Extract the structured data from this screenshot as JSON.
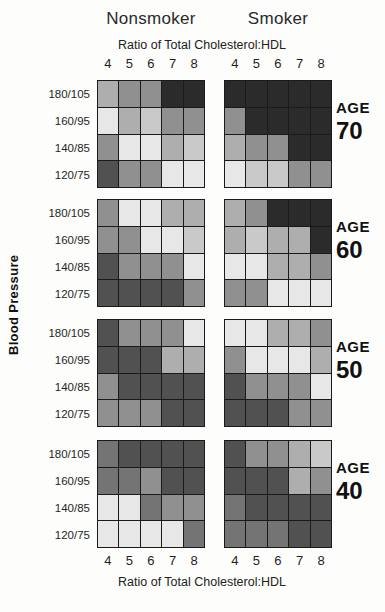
{
  "title_nonsmoker": "Nonsmoker",
  "title_smoker": "Smoker",
  "axis_label_top": "Ratio of Total Cholesterol:HDL",
  "axis_label_bottom": "Ratio of Total Cholesterol:HDL",
  "y_axis_label": "Blood Pressure",
  "age_word": "AGE",
  "ratio_ticks": [
    "4",
    "5",
    "6",
    "7",
    "8"
  ],
  "bp_labels": [
    "180/105",
    "160/95",
    "140/85",
    "120/75"
  ],
  "palette": {
    "VD": "#2b2b2b",
    "D": "#515151",
    "MD": "#747474",
    "M": "#909090",
    "ML": "#aeaeae",
    "L": "#c9c9c9",
    "VL": "#e7e7e7"
  },
  "chart_data": {
    "type": "heatmap",
    "x_categories": [
      "4",
      "5",
      "6",
      "7",
      "8"
    ],
    "xlabel": "Ratio of Total Cholesterol:HDL",
    "y_categories": [
      "180/105",
      "160/95",
      "140/85",
      "120/75"
    ],
    "ylabel": "Blood Pressure",
    "column_groups": [
      "Nonsmoker",
      "Smoker"
    ],
    "row_groups": [
      "AGE 70",
      "AGE 60",
      "AGE 50",
      "AGE 40"
    ],
    "shade_scale_note": "cell codes are gray shades: VD=darkest, D=dark, MD=medium-dark, M=medium, ML=medium-light, L=light, VL=lightest",
    "ages": [
      "70",
      "60",
      "50",
      "40"
    ],
    "grids": {
      "age70_ns": [
        [
          "ML",
          "M",
          "M",
          "VD",
          "VD"
        ],
        [
          "VL",
          "ML",
          "L",
          "M",
          "M"
        ],
        [
          "M",
          "VL",
          "VL",
          "ML",
          "L"
        ],
        [
          "D",
          "M",
          "M",
          "VL",
          "VL"
        ]
      ],
      "age70_s": [
        [
          "VD",
          "VD",
          "VD",
          "VD",
          "VD"
        ],
        [
          "M",
          "VD",
          "VD",
          "VD",
          "VD"
        ],
        [
          "ML",
          "M",
          "M",
          "VD",
          "VD"
        ],
        [
          "VL",
          "L",
          "L",
          "M",
          "M"
        ]
      ],
      "age60_ns": [
        [
          "M",
          "VL",
          "VL",
          "ML",
          "ML"
        ],
        [
          "M",
          "M",
          "VL",
          "VL",
          "L"
        ],
        [
          "D",
          "M",
          "M",
          "M",
          "VL"
        ],
        [
          "D",
          "D",
          "D",
          "D",
          "M"
        ]
      ],
      "age60_s": [
        [
          "ML",
          "M",
          "VD",
          "VD",
          "VD"
        ],
        [
          "ML",
          "L",
          "ML",
          "ML",
          "VD"
        ],
        [
          "VL",
          "VL",
          "ML",
          "ML",
          "M"
        ],
        [
          "M",
          "M",
          "VL",
          "VL",
          "VL"
        ]
      ],
      "age50_ns": [
        [
          "D",
          "M",
          "M",
          "M",
          "VL"
        ],
        [
          "D",
          "D",
          "D",
          "ML",
          "ML"
        ],
        [
          "M",
          "D",
          "D",
          "D",
          "D"
        ],
        [
          "M",
          "M",
          "M",
          "D",
          "D"
        ]
      ],
      "age50_s": [
        [
          "VL",
          "VL",
          "ML",
          "ML",
          "M"
        ],
        [
          "M",
          "VL",
          "VL",
          "VL",
          "ML"
        ],
        [
          "D",
          "M",
          "M",
          "M",
          "VL"
        ],
        [
          "D",
          "D",
          "D",
          "M",
          "M"
        ]
      ],
      "age40_ns": [
        [
          "MD",
          "D",
          "D",
          "D",
          "D"
        ],
        [
          "MD",
          "MD",
          "M",
          "D",
          "D"
        ],
        [
          "VL",
          "VL",
          "MD",
          "M",
          "M"
        ],
        [
          "VL",
          "VL",
          "VL",
          "VL",
          "MD"
        ]
      ],
      "age40_s": [
        [
          "D",
          "M",
          "M",
          "ML",
          "L"
        ],
        [
          "D",
          "D",
          "D",
          "ML",
          "M"
        ],
        [
          "MD",
          "D",
          "D",
          "D",
          "D"
        ],
        [
          "MD",
          "MD",
          "MD",
          "D",
          "D"
        ]
      ]
    }
  }
}
